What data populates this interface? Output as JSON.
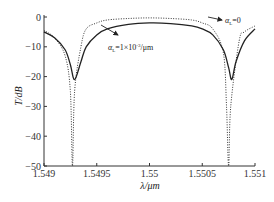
{
  "chart_data": {
    "type": "line",
    "title": "",
    "xlabel": "λ/μm",
    "ylabel": "T/dB",
    "xlim": [
      1.549,
      1.551
    ],
    "ylim": [
      -50,
      0
    ],
    "x_ticks": [
      "1.549",
      "1.5495",
      "1.55",
      "1.5505",
      "1.551"
    ],
    "y_ticks": [
      "0",
      "-10",
      "-20",
      "-30",
      "-40",
      "-50"
    ],
    "grid": false,
    "legend": "annotations with arrows",
    "series": [
      {
        "name": "α_L=1×10⁻³/μm",
        "style": "solid",
        "x": [
          1.549,
          1.5491,
          1.5492,
          1.54925,
          1.54929,
          1.54935,
          1.5494,
          1.5495,
          1.5496,
          1.5498,
          1.55,
          1.5502,
          1.5504,
          1.5505,
          1.5506,
          1.5507,
          1.55075,
          1.55078,
          1.55082,
          1.5509,
          1.551
        ],
        "values": [
          -5,
          -7,
          -11,
          -16,
          -21,
          -15,
          -10,
          -6,
          -4,
          -2.5,
          -2,
          -2.2,
          -3,
          -4,
          -6,
          -11,
          -17,
          -21,
          -15,
          -8,
          -4
        ]
      },
      {
        "name": "α_L=0",
        "style": "dotted",
        "x": [
          1.549,
          1.5491,
          1.5492,
          1.54925,
          1.54927,
          1.54929,
          1.54935,
          1.5494,
          1.5495,
          1.5496,
          1.5498,
          1.55,
          1.5502,
          1.5504,
          1.5505,
          1.5506,
          1.5507,
          1.55073,
          1.55075,
          1.55077,
          1.55085,
          1.5509,
          1.551
        ],
        "values": [
          -4.5,
          -7,
          -13,
          -25,
          -50,
          -25,
          -10,
          -4,
          -2,
          -1,
          -0.5,
          -0.3,
          -0.5,
          -1,
          -2,
          -4,
          -12,
          -30,
          -50,
          -30,
          -8,
          -5,
          -3
        ]
      }
    ],
    "annotations": [
      {
        "text_main": "α",
        "text_sub": "L",
        "text_rest": "=1×10",
        "text_sup": "-3",
        "text_unit": "/μm",
        "arrow_to_series": "solid"
      },
      {
        "text_main": "α",
        "text_sub": "L",
        "text_rest": "=0",
        "arrow_to_series": "dotted"
      }
    ]
  },
  "labels": {
    "xlabel": "λ/μm",
    "ylabel": "T/dB",
    "annot_solid_main": "α",
    "annot_solid_sub": "L",
    "annot_solid_rest": "=1×10",
    "annot_solid_sup": "-3",
    "annot_solid_unit": "/μm",
    "annot_dotted_main": "α",
    "annot_dotted_sub": "L",
    "annot_dotted_rest": "=0"
  }
}
